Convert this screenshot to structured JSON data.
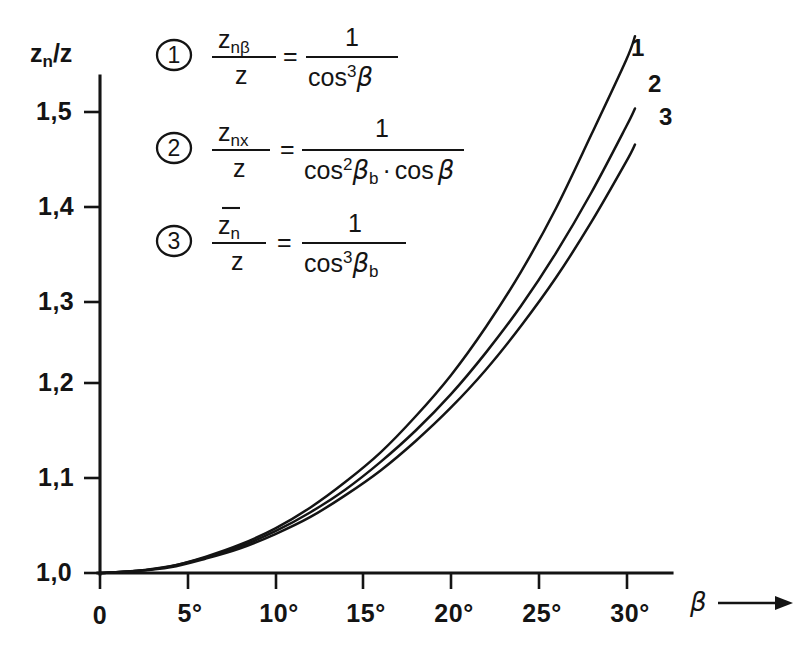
{
  "figure": {
    "background_color": "#ffffff",
    "ink_color": "#141414"
  },
  "axes": {
    "y_axis_title": "z_n/z",
    "y_axis_title_parts": {
      "base": "z",
      "sub": "n",
      "slash": "/",
      "denom": "z"
    },
    "x_axis_title": "β",
    "x_axis_arrow": "→",
    "y_ticks": [
      "1,0",
      "1,1",
      "1,2",
      "1,3",
      "1,4",
      "1,5"
    ],
    "y_tick_values": [
      1.0,
      1.1,
      1.2,
      1.3,
      1.4,
      1.5
    ],
    "x_ticks": [
      "0",
      "5°",
      "10°",
      "15°",
      "20°",
      "25°",
      "30°"
    ],
    "x_tick_values": [
      0,
      5,
      10,
      15,
      20,
      25,
      30
    ],
    "x_range": [
      0,
      31.2
    ],
    "y_range": [
      1.0,
      1.553
    ],
    "grid": false
  },
  "legend": {
    "position": "upper-left-inside",
    "entries": [
      {
        "badge": "1",
        "lhs_num_base": "z",
        "lhs_num_sub": "nβ",
        "lhs_den": "z",
        "equals": "=",
        "rhs_num": "1",
        "rhs_den_fn": "cos",
        "rhs_den_sup": "3",
        "rhs_den_arg": "β",
        "formula_text": "z_nβ / z = 1 / cos³β"
      },
      {
        "badge": "2",
        "lhs_num_base": "z",
        "lhs_num_sub": "nx",
        "lhs_den": "z",
        "equals": "=",
        "rhs_num": "1",
        "rhs_den_fn": "cos",
        "rhs_den_sup": "2",
        "rhs_den_arg": "β",
        "rhs_den_arg_sub": "b",
        "rhs_den_op": "·",
        "rhs_den_fn2": "cos",
        "rhs_den_arg2": "β",
        "formula_text": "z_nx / z = 1 / (cos²β_b · cos β)"
      },
      {
        "badge": "3",
        "lhs_num_base": "z",
        "lhs_num_sub": "n",
        "lhs_num_overbar": true,
        "lhs_den": "z",
        "equals": "=",
        "rhs_num": "1",
        "rhs_den_fn": "cos",
        "rhs_den_sup": "3",
        "rhs_den_arg": "β",
        "rhs_den_arg_sub": "b",
        "formula_text": "z̄_n / z = 1 / cos³β_b"
      }
    ]
  },
  "curve_labels": [
    "1",
    "2",
    "3"
  ],
  "chart_data": {
    "type": "line",
    "title": "",
    "xlabel": "β",
    "ylabel": "z_n/z",
    "xlim": [
      0,
      31.2
    ],
    "ylim": [
      1.0,
      1.553
    ],
    "grid": false,
    "x_tick_labels": [
      "0",
      "5°",
      "10°",
      "15°",
      "20°",
      "25°",
      "30°"
    ],
    "y_tick_labels": [
      "1,0",
      "1,1",
      "1,2",
      "1,3",
      "1,4",
      "1,5"
    ],
    "x": [
      0,
      2,
      4,
      6,
      8,
      10,
      12,
      14,
      16,
      18,
      20,
      22,
      24,
      26,
      28,
      30,
      30.5
    ],
    "series": [
      {
        "name": "1",
        "label": "1",
        "legend_badge": "1",
        "expression": "1/cos^3(beta)",
        "values": [
          1.0,
          1.002,
          1.007,
          1.017,
          1.03,
          1.047,
          1.069,
          1.096,
          1.127,
          1.165,
          1.208,
          1.259,
          1.317,
          1.384,
          1.461,
          1.54,
          1.565
        ],
        "end_label_xy": [
          30.4,
          1.553
        ]
      },
      {
        "name": "2",
        "label": "2",
        "legend_badge": "2",
        "expression": "1/(cos^2(beta_b)*cos(beta)), beta_b from alpha_n=20deg",
        "values": [
          1.0,
          1.002,
          1.007,
          1.016,
          1.028,
          1.044,
          1.064,
          1.088,
          1.117,
          1.15,
          1.188,
          1.232,
          1.281,
          1.337,
          1.4,
          1.47,
          1.489
        ],
        "end_label_xy": [
          30.6,
          1.482
        ]
      },
      {
        "name": "3",
        "label": "3",
        "legend_badge": "3",
        "expression": "1/cos^3(beta_b), beta_b from alpha_n=20deg",
        "values": [
          1.0,
          1.002,
          1.006,
          1.015,
          1.026,
          1.041,
          1.059,
          1.082,
          1.108,
          1.139,
          1.174,
          1.214,
          1.26,
          1.311,
          1.369,
          1.433,
          1.451
        ],
        "end_label_xy": [
          30.8,
          1.462
        ]
      }
    ]
  }
}
